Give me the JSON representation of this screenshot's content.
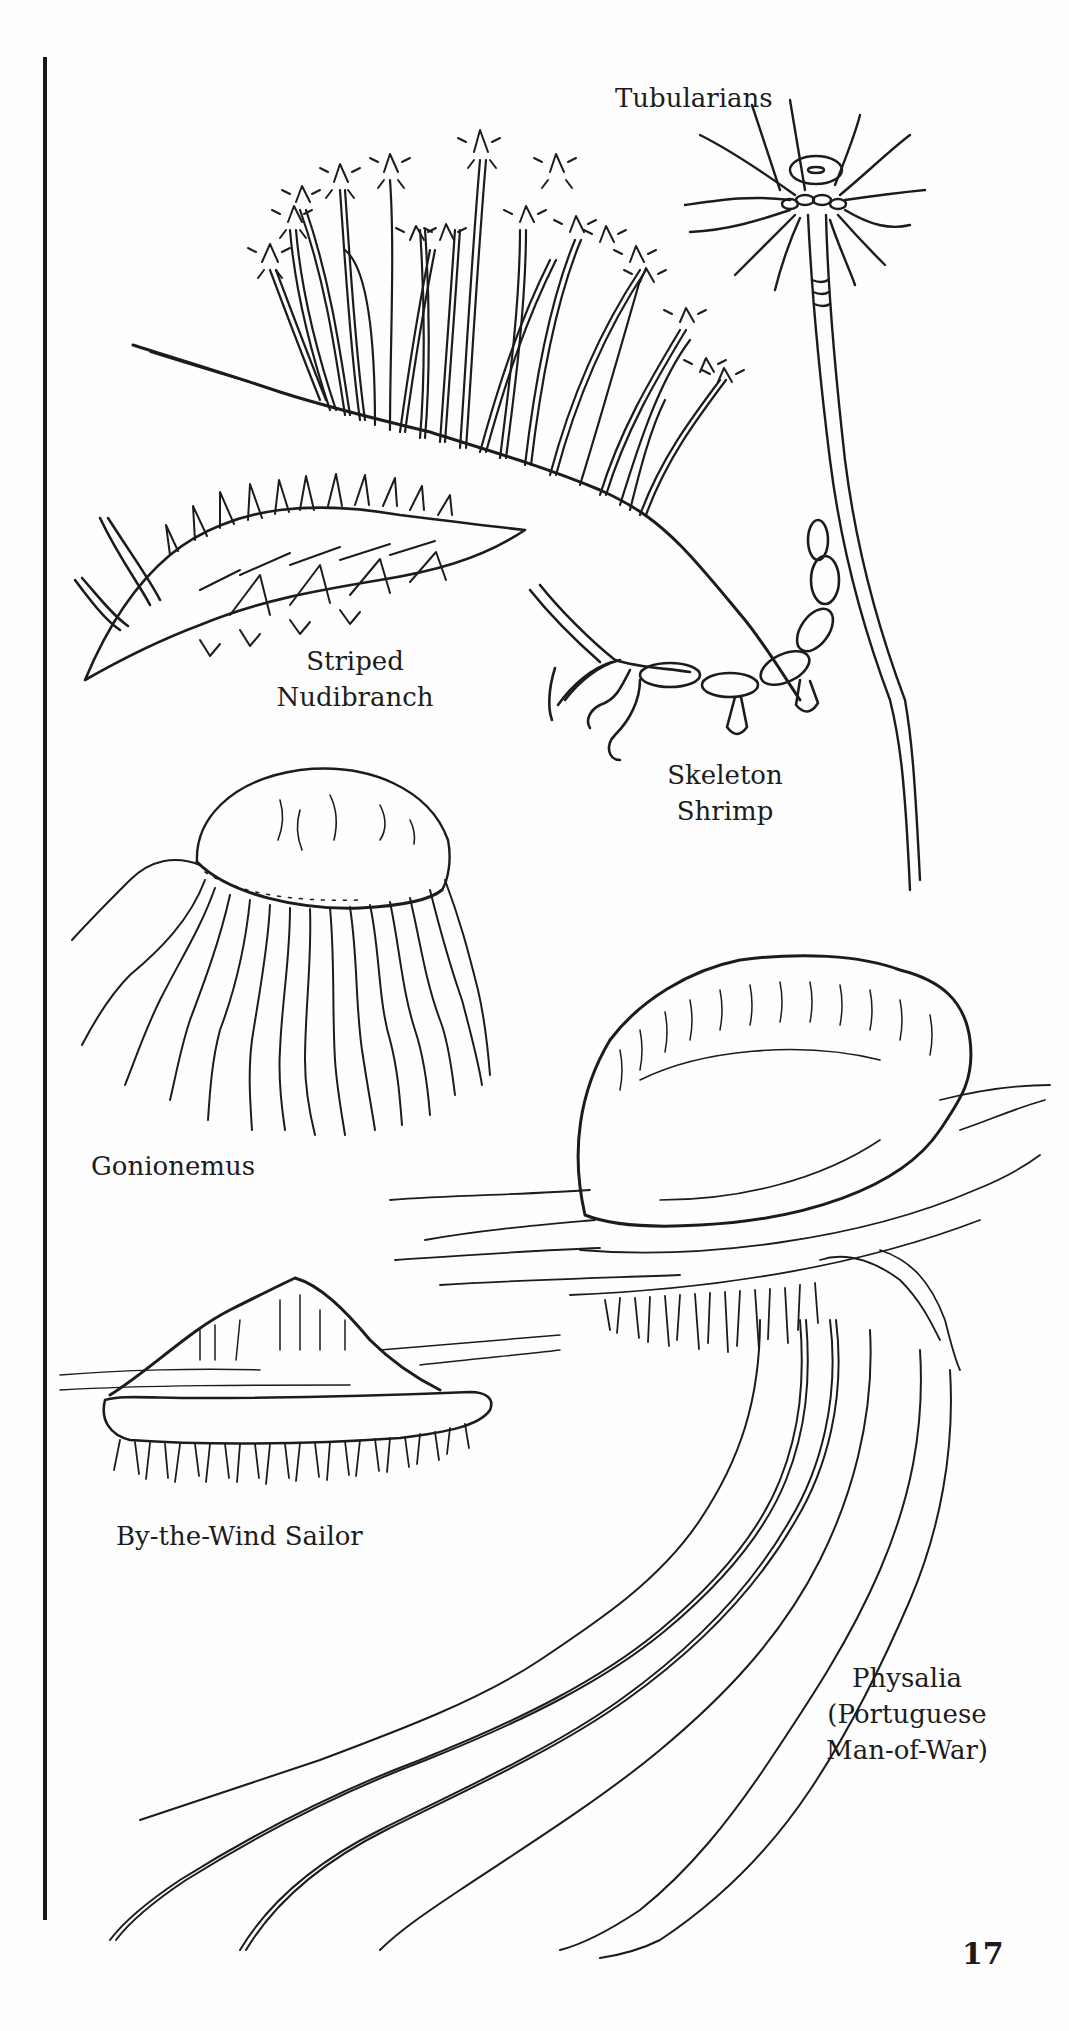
{
  "page": {
    "number": "17",
    "ink_color": "#1c1c1c",
    "paper_color": "#fefefe"
  },
  "illustrations": [
    {
      "id": "tubularians",
      "label_lines": [
        "Tubularians"
      ]
    },
    {
      "id": "striped-nudibranch",
      "label_lines": [
        "Striped",
        "Nudibranch"
      ]
    },
    {
      "id": "skeleton-shrimp",
      "label_lines": [
        "Skeleton",
        "Shrimp"
      ]
    },
    {
      "id": "gonionemus",
      "label_lines": [
        "Gonionemus"
      ]
    },
    {
      "id": "by-the-wind-sailor",
      "label_lines": [
        "By-the-Wind Sailor"
      ]
    },
    {
      "id": "physalia",
      "label_lines": [
        "Physalia",
        "(Portuguese",
        "Man-of-War)"
      ]
    }
  ]
}
